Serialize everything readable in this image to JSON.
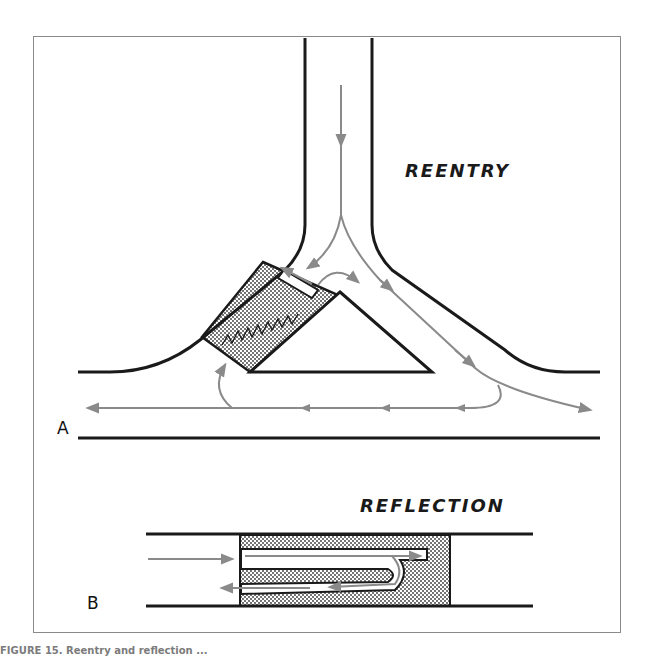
{
  "figure": {
    "panels": [
      {
        "id": "A",
        "label": "A",
        "title": "REENTRY",
        "description": "Impulse descends a single pathway, divides around a central triangular obstacle; a depressed (stippled) segment with unidirectional block on the left limb allows the impulse traveling around via the lower branch to re-enter retrogradely."
      },
      {
        "id": "B",
        "label": "B",
        "title": "REFLECTION",
        "description": "Impulse enters a stippled (depressed) segment of a linear pathway, travels forward, reverses within the segment and returns backward (reflection)."
      }
    ],
    "colors": {
      "pathway": "#1a1a1a",
      "impulse_arrow": "#8a8a8a",
      "stipple": "#333333",
      "background": "#ffffff"
    },
    "caption": "FIGURE 15. Reentry and reflection ..."
  }
}
